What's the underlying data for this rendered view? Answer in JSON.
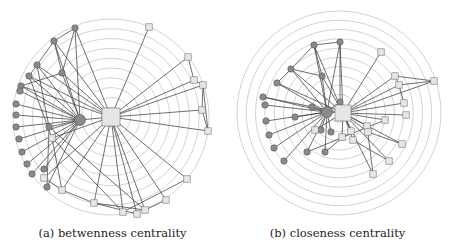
{
  "figure": {
    "panels": [
      {
        "id": "a",
        "caption": "(a) betwenness centrality",
        "center": [
          111,
          117
        ],
        "ring_count": 10,
        "outer_radius": 98
      },
      {
        "id": "b",
        "caption": "(b) closeness centrality",
        "center": [
          114,
          113
        ],
        "ring_count": 11,
        "outer_radius": 102
      }
    ],
    "colors": {
      "ring": "#c8c8c8",
      "edge": "#3a3a3a",
      "circle_node_fill": "#8a8a8a",
      "square_node_fill": "#e6e6e6"
    }
  }
}
